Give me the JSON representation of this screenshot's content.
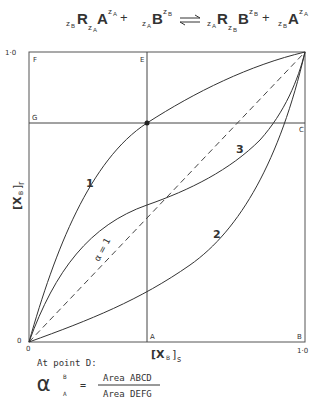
{
  "equation": {
    "lhs1": {
      "pre_sub": "z",
      "pre_sub2": "B",
      "R": "R",
      "R_sub": "z",
      "R_sub2": "A",
      "A": "A",
      "A_sup": "z",
      "A_sup2": "A"
    },
    "plus": "+",
    "lhs2": {
      "pre_sub": "z",
      "pre_sub2": "A",
      "B": "B",
      "B_sup": "z",
      "B_sup2": "B"
    },
    "arrow": "⇌",
    "rhs1": {
      "pre_sub": "z",
      "pre_sub2": "A",
      "R": "R",
      "R_sub": "z",
      "R_sub2": "B",
      "B": "B",
      "B_sup": "z",
      "B_sup2": "B"
    },
    "rhs2": {
      "pre_sub": "z",
      "pre_sub2": "B",
      "A": "A",
      "A_sup": "z",
      "A_sup2": "A"
    }
  },
  "diagram": {
    "y_axis_label": "[X",
    "y_axis_sub": "B",
    "y_axis_suffix": "]",
    "y_axis_sub2": "r",
    "x_axis_label": "[X",
    "x_axis_sub": "B",
    "x_axis_suffix": "]",
    "x_axis_sub2": "s",
    "y_top_tick": "1·0",
    "y_bottom_tick": "0",
    "x_left_tick": "0",
    "x_right_tick": "1·0",
    "points": {
      "A": "A",
      "B": "B",
      "C": "C",
      "E": "E",
      "F": "F",
      "G": "G"
    },
    "curves": [
      {
        "label": "1"
      },
      {
        "label": "2"
      },
      {
        "label": "3"
      }
    ],
    "diagonal_label": "α = 1"
  },
  "caption": {
    "intro": "At point D:",
    "alpha": "α",
    "alpha_sup": "B",
    "alpha_sub": "A",
    "equals": "=",
    "numerator": "Area ABCD",
    "denominator": "Area DEFG"
  }
}
